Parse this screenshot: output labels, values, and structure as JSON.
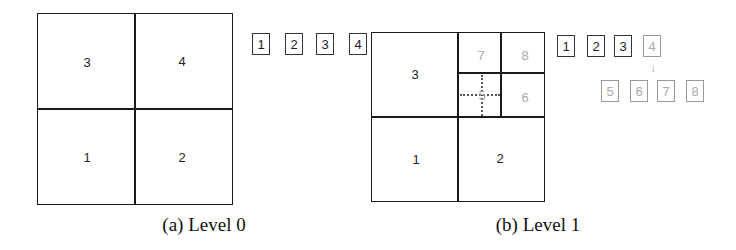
{
  "panels": [
    {
      "id": "a",
      "caption": "(a) Level 0",
      "cells": [
        {
          "label": "3",
          "style": "dark"
        },
        {
          "label": "4",
          "style": "dark"
        },
        {
          "label": "1",
          "style": "dark"
        },
        {
          "label": "2",
          "style": "dark"
        }
      ],
      "list": {
        "row1": [
          "1",
          "2",
          "3",
          "4"
        ]
      }
    },
    {
      "id": "b",
      "caption": "(b) Level 1",
      "cells": [
        {
          "label": "3",
          "style": "dark"
        },
        {
          "label": "7",
          "style": "gray"
        },
        {
          "label": "8",
          "style": "gray"
        },
        {
          "label": "5",
          "style": "gray"
        },
        {
          "label": "6",
          "style": "gray"
        },
        {
          "label": "1",
          "style": "dark"
        },
        {
          "label": "2",
          "style": "dark"
        }
      ],
      "list": {
        "row1": [
          "1",
          "2",
          "3",
          "4"
        ],
        "row2": [
          "5",
          "6",
          "7",
          "8"
        ],
        "arrow": "down-arrow"
      }
    }
  ],
  "colors": {
    "line": "#1a1a1a",
    "gray_text": "#aaaaaa",
    "dark_text": "#222222"
  }
}
